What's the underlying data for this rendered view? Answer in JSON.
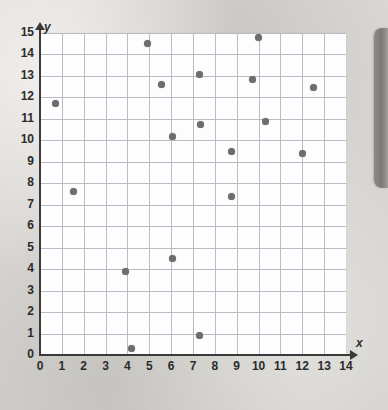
{
  "chart_data": {
    "type": "scatter",
    "title": "",
    "xlabel": "x",
    "ylabel": "y",
    "xlim": [
      0,
      14
    ],
    "ylim": [
      0,
      15
    ],
    "grid": true,
    "legend": null,
    "x_ticks": [
      "0",
      "1",
      "2",
      "3",
      "4",
      "5",
      "6",
      "7",
      "8",
      "9",
      "10",
      "11",
      "12",
      "13",
      "14"
    ],
    "y_ticks": [
      "0",
      "1",
      "2",
      "3",
      "4",
      "5",
      "6",
      "7",
      "8",
      "9",
      "10",
      "11",
      "12",
      "13",
      "14",
      "15"
    ],
    "point_color": "#6d6d6d",
    "grid_color": "#b9bcc4",
    "axis_color": "#3a3a3a",
    "plot_background": "#fdfdfd",
    "page_background": "#d9d7d3",
    "points": [
      {
        "x": 0.7,
        "y": 11.7
      },
      {
        "x": 1.55,
        "y": 7.6
      },
      {
        "x": 3.9,
        "y": 3.9
      },
      {
        "x": 4.2,
        "y": 0.3
      },
      {
        "x": 4.9,
        "y": 14.5
      },
      {
        "x": 5.55,
        "y": 12.6
      },
      {
        "x": 6.05,
        "y": 10.2
      },
      {
        "x": 6.05,
        "y": 4.5
      },
      {
        "x": 7.3,
        "y": 13.05
      },
      {
        "x": 7.35,
        "y": 10.75
      },
      {
        "x": 7.3,
        "y": 0.9
      },
      {
        "x": 8.75,
        "y": 9.5
      },
      {
        "x": 8.75,
        "y": 7.4
      },
      {
        "x": 9.7,
        "y": 12.85
      },
      {
        "x": 10.0,
        "y": 14.8
      },
      {
        "x": 10.3,
        "y": 10.9
      },
      {
        "x": 12.0,
        "y": 9.4
      },
      {
        "x": 12.5,
        "y": 12.45
      }
    ]
  },
  "page": {
    "side_tab_label": ""
  }
}
